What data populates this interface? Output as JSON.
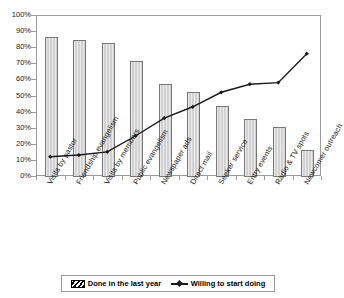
{
  "chart_data": {
    "type": "bar",
    "title": "",
    "xlabel": "",
    "ylabel": "",
    "ylim": [
      0,
      100
    ],
    "grid": false,
    "legend_position": "bottom",
    "categories": [
      "Visits by pastor",
      "Friendship evangelism",
      "Visits by members",
      "Public evangelism",
      "Newspaper ads",
      "Direct mail",
      "Seeker service",
      "Entry events",
      "Radio & TV spots",
      "Newcomer outreach"
    ],
    "ytick_labels": [
      "0%",
      "10%",
      "20%",
      "30%",
      "40%",
      "50%",
      "60%",
      "70%",
      "80%",
      "90%",
      "100%"
    ],
    "ytick_values": [
      0,
      10,
      20,
      30,
      40,
      50,
      60,
      70,
      80,
      90,
      100
    ],
    "series": [
      {
        "name": "Done in the last year",
        "type": "bar",
        "color": "#d2d2d2",
        "values": [
          87,
          85,
          83,
          72,
          58,
          53,
          44,
          36,
          31,
          17
        ]
      },
      {
        "name": "Willing to start doing",
        "type": "line",
        "color": "#1a1a1a",
        "marker": "diamond",
        "values": [
          12,
          13,
          15,
          25,
          36,
          43,
          52,
          57,
          58,
          76
        ]
      }
    ]
  },
  "legend": {
    "items": [
      {
        "label": "Done in the last year",
        "swatch": "hatched-bar-swatch"
      },
      {
        "label": "Willing to start doing",
        "swatch": "line-marker-swatch"
      }
    ]
  }
}
